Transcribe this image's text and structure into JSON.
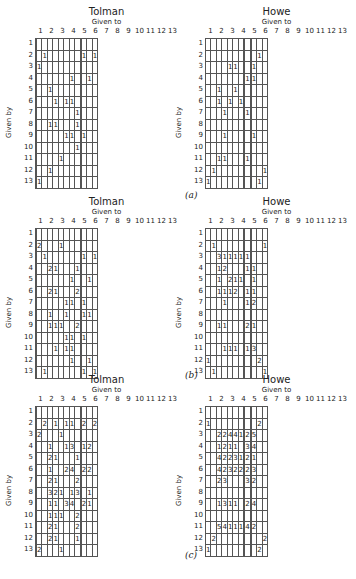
{
  "figure": {
    "captions": [
      "(a)",
      "(b)",
      "(c)"
    ],
    "col_axis_label": "Given to",
    "row_axis_label": "Given by",
    "labels": [
      "1",
      "2",
      "3",
      "4",
      "5",
      "6",
      "7",
      "8",
      "9",
      "10",
      "11",
      "12",
      "13"
    ]
  },
  "chart_data": [
    {
      "type": "table",
      "panel": "(a)",
      "title": "Tolman",
      "xlabel": "Given to",
      "ylabel": "Given by",
      "cells": [
        [
          2,
          3,
          1
        ],
        [
          2,
          11,
          1
        ],
        [
          2,
          13,
          1
        ],
        [
          3,
          2,
          1
        ],
        [
          4,
          8,
          1
        ],
        [
          4,
          12,
          1
        ],
        [
          5,
          4,
          1
        ],
        [
          6,
          5,
          1
        ],
        [
          6,
          7,
          1
        ],
        [
          6,
          8,
          1
        ],
        [
          7,
          9,
          1
        ],
        [
          8,
          4,
          1
        ],
        [
          8,
          5,
          1
        ],
        [
          8,
          9,
          1
        ],
        [
          9,
          7,
          1
        ],
        [
          9,
          8,
          1
        ],
        [
          9,
          11,
          1
        ],
        [
          10,
          9,
          1
        ],
        [
          11,
          6,
          1
        ],
        [
          12,
          4,
          1
        ],
        [
          13,
          2,
          1
        ]
      ]
    },
    {
      "type": "table",
      "panel": "(a)",
      "title": "Howe",
      "xlabel": "Given to",
      "ylabel": "Given by",
      "cells": [
        [
          2,
          12,
          1
        ],
        [
          3,
          5,
          1
        ],
        [
          3,
          6,
          1
        ],
        [
          3,
          11,
          1
        ],
        [
          4,
          9,
          1
        ],
        [
          4,
          11,
          1
        ],
        [
          5,
          3,
          1
        ],
        [
          5,
          6,
          1
        ],
        [
          6,
          3,
          1
        ],
        [
          6,
          5,
          1
        ],
        [
          6,
          7,
          1
        ],
        [
          7,
          4,
          1
        ],
        [
          7,
          9,
          1
        ],
        [
          9,
          4,
          1
        ],
        [
          9,
          11,
          1
        ],
        [
          11,
          3,
          1
        ],
        [
          11,
          4,
          1
        ],
        [
          11,
          9,
          1
        ],
        [
          12,
          2,
          1
        ],
        [
          12,
          13,
          1
        ],
        [
          13,
          1,
          1
        ],
        [
          13,
          12,
          1
        ]
      ]
    },
    {
      "type": "table",
      "panel": "(b)",
      "title": "Tolman",
      "xlabel": "Given to",
      "ylabel": "Given by",
      "cells": [
        [
          2,
          2,
          2
        ],
        [
          2,
          6,
          1
        ],
        [
          3,
          3,
          1
        ],
        [
          3,
          11,
          1
        ],
        [
          3,
          13,
          1
        ],
        [
          4,
          4,
          2
        ],
        [
          4,
          5,
          1
        ],
        [
          4,
          9,
          1
        ],
        [
          5,
          8,
          1
        ],
        [
          5,
          12,
          1
        ],
        [
          6,
          4,
          2
        ],
        [
          6,
          5,
          1
        ],
        [
          6,
          9,
          2
        ],
        [
          7,
          7,
          1
        ],
        [
          7,
          8,
          1
        ],
        [
          7,
          11,
          1
        ],
        [
          8,
          4,
          1
        ],
        [
          8,
          7,
          1
        ],
        [
          8,
          11,
          1
        ],
        [
          8,
          12,
          1
        ],
        [
          9,
          4,
          1
        ],
        [
          9,
          5,
          1
        ],
        [
          9,
          6,
          1
        ],
        [
          9,
          9,
          2
        ],
        [
          10,
          7,
          1
        ],
        [
          10,
          8,
          1
        ],
        [
          10,
          11,
          1
        ],
        [
          11,
          5,
          1
        ],
        [
          11,
          7,
          1
        ],
        [
          11,
          8,
          1
        ],
        [
          12,
          8,
          1
        ],
        [
          12,
          12,
          1
        ],
        [
          13,
          3,
          1
        ],
        [
          13,
          11,
          1
        ],
        [
          13,
          13,
          1
        ]
      ]
    },
    {
      "type": "table",
      "panel": "(b)",
      "title": "Howe",
      "xlabel": "Given to",
      "ylabel": "Given by",
      "cells": [
        [
          2,
          2,
          1
        ],
        [
          2,
          13,
          1
        ],
        [
          3,
          3,
          3
        ],
        [
          3,
          4,
          1
        ],
        [
          3,
          5,
          1
        ],
        [
          3,
          6,
          1
        ],
        [
          3,
          7,
          1
        ],
        [
          3,
          9,
          1
        ],
        [
          4,
          3,
          1
        ],
        [
          4,
          4,
          2
        ],
        [
          4,
          9,
          1
        ],
        [
          4,
          11,
          1
        ],
        [
          5,
          3,
          1
        ],
        [
          5,
          5,
          2
        ],
        [
          5,
          6,
          1
        ],
        [
          5,
          7,
          1
        ],
        [
          5,
          11,
          1
        ],
        [
          6,
          3,
          1
        ],
        [
          6,
          4,
          1
        ],
        [
          6,
          5,
          1
        ],
        [
          6,
          6,
          2
        ],
        [
          6,
          9,
          1
        ],
        [
          6,
          11,
          1
        ],
        [
          7,
          4,
          1
        ],
        [
          7,
          9,
          1
        ],
        [
          7,
          11,
          2
        ],
        [
          9,
          3,
          1
        ],
        [
          9,
          4,
          1
        ],
        [
          9,
          9,
          2
        ],
        [
          9,
          11,
          1
        ],
        [
          11,
          4,
          1
        ],
        [
          11,
          5,
          1
        ],
        [
          11,
          6,
          1
        ],
        [
          11,
          9,
          1
        ],
        [
          11,
          11,
          3
        ],
        [
          12,
          1,
          1
        ],
        [
          12,
          12,
          2
        ],
        [
          13,
          2,
          1
        ],
        [
          13,
          13,
          1
        ]
      ]
    },
    {
      "type": "table",
      "panel": "(c)",
      "title": "Tolman",
      "xlabel": "Given to",
      "ylabel": "Given by",
      "cells": [
        [
          2,
          3,
          2
        ],
        [
          2,
          5,
          1
        ],
        [
          2,
          7,
          1
        ],
        [
          2,
          8,
          1
        ],
        [
          2,
          11,
          2
        ],
        [
          2,
          13,
          2
        ],
        [
          3,
          2,
          2
        ],
        [
          3,
          6,
          1
        ],
        [
          4,
          4,
          1
        ],
        [
          4,
          7,
          1
        ],
        [
          4,
          8,
          3
        ],
        [
          4,
          11,
          1
        ],
        [
          4,
          12,
          2
        ],
        [
          5,
          4,
          2
        ],
        [
          5,
          5,
          1
        ],
        [
          5,
          9,
          1
        ],
        [
          6,
          4,
          1
        ],
        [
          6,
          7,
          2
        ],
        [
          6,
          8,
          4
        ],
        [
          6,
          11,
          2
        ],
        [
          6,
          12,
          2
        ],
        [
          7,
          4,
          2
        ],
        [
          7,
          5,
          1
        ],
        [
          7,
          9,
          2
        ],
        [
          8,
          4,
          3
        ],
        [
          8,
          5,
          2
        ],
        [
          8,
          6,
          1
        ],
        [
          8,
          8,
          1
        ],
        [
          8,
          9,
          3
        ],
        [
          8,
          12,
          1
        ],
        [
          9,
          4,
          1
        ],
        [
          9,
          5,
          1
        ],
        [
          9,
          7,
          3
        ],
        [
          9,
          8,
          4
        ],
        [
          9,
          11,
          2
        ],
        [
          9,
          12,
          1
        ],
        [
          10,
          4,
          1
        ],
        [
          10,
          5,
          1
        ],
        [
          10,
          6,
          1
        ],
        [
          10,
          9,
          2
        ],
        [
          11,
          4,
          2
        ],
        [
          11,
          5,
          1
        ],
        [
          11,
          9,
          2
        ],
        [
          12,
          4,
          2
        ],
        [
          12,
          5,
          1
        ],
        [
          12,
          9,
          1
        ],
        [
          13,
          2,
          2
        ],
        [
          13,
          6,
          1
        ]
      ]
    },
    {
      "type": "table",
      "panel": "(c)",
      "title": "Howe",
      "xlabel": "Given to",
      "ylabel": "Given by",
      "cells": [
        [
          2,
          1,
          1
        ],
        [
          2,
          12,
          2
        ],
        [
          3,
          3,
          2
        ],
        [
          3,
          4,
          2
        ],
        [
          3,
          5,
          4
        ],
        [
          3,
          6,
          4
        ],
        [
          3,
          7,
          1
        ],
        [
          3,
          9,
          2
        ],
        [
          3,
          11,
          5
        ],
        [
          4,
          3,
          1
        ],
        [
          4,
          4,
          2
        ],
        [
          4,
          5,
          1
        ],
        [
          4,
          6,
          1
        ],
        [
          4,
          9,
          3
        ],
        [
          4,
          11,
          4
        ],
        [
          5,
          3,
          4
        ],
        [
          5,
          4,
          2
        ],
        [
          5,
          5,
          2
        ],
        [
          5,
          6,
          3
        ],
        [
          5,
          7,
          1
        ],
        [
          5,
          9,
          2
        ],
        [
          5,
          11,
          1
        ],
        [
          6,
          3,
          4
        ],
        [
          6,
          4,
          2
        ],
        [
          6,
          5,
          3
        ],
        [
          6,
          6,
          2
        ],
        [
          6,
          7,
          2
        ],
        [
          6,
          9,
          2
        ],
        [
          6,
          11,
          3
        ],
        [
          7,
          3,
          2
        ],
        [
          7,
          4,
          3
        ],
        [
          7,
          9,
          3
        ],
        [
          7,
          11,
          2
        ],
        [
          9,
          3,
          1
        ],
        [
          9,
          4,
          3
        ],
        [
          9,
          5,
          1
        ],
        [
          9,
          6,
          1
        ],
        [
          9,
          9,
          2
        ],
        [
          9,
          11,
          4
        ],
        [
          11,
          3,
          5
        ],
        [
          11,
          4,
          4
        ],
        [
          11,
          5,
          1
        ],
        [
          11,
          6,
          1
        ],
        [
          11,
          7,
          1
        ],
        [
          11,
          9,
          4
        ],
        [
          11,
          11,
          2
        ],
        [
          12,
          2,
          2
        ],
        [
          12,
          13,
          2
        ],
        [
          13,
          1,
          1
        ],
        [
          13,
          12,
          2
        ]
      ]
    }
  ]
}
